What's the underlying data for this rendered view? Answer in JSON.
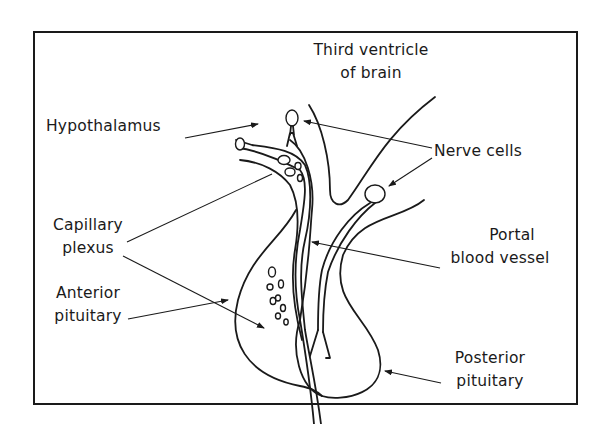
{
  "diagram": {
    "type": "anatomical-illustration",
    "labels": {
      "third_ventricle_line1": "Third ventricle",
      "third_ventricle_line2": "of brain",
      "hypothalamus": "Hypothalamus",
      "nerve_cells": "Nerve cells",
      "capillary_line1": "Capillary",
      "capillary_line2": "plexus",
      "portal_line1": "Portal",
      "portal_line2": "blood vessel",
      "anterior_line1": "Anterior",
      "anterior_line2": "pituitary",
      "posterior_line1": "Posterior",
      "posterior_line2": "pituitary"
    },
    "colors": {
      "ink": "#1a1a1a",
      "background": "#ffffff"
    }
  }
}
